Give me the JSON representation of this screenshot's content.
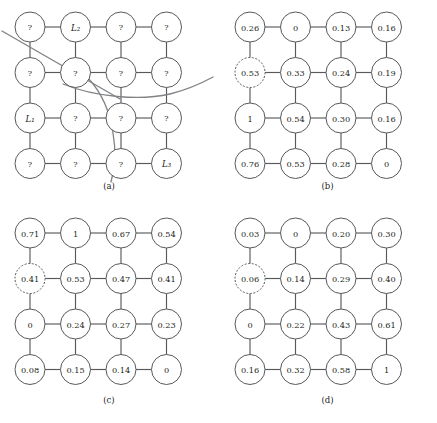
{
  "figure": {
    "panels": [
      {
        "id": "a",
        "caption": "(a)",
        "type": "unknown-labels",
        "rows": 4,
        "cols": 4,
        "dashed_node": null,
        "cells": [
          [
            "?",
            "L₂",
            "?",
            "?"
          ],
          [
            "?",
            "?",
            "?",
            "?"
          ],
          [
            "L₁",
            "?",
            "?",
            "?"
          ],
          [
            "?",
            "?",
            "?",
            "L₃"
          ]
        ],
        "overlay_curves": [
          "diagonal-line-upper-left-to-lower-right",
          "sweeping-curve-left-to-right-edge",
          "descending-curve-through-bottom-row"
        ]
      },
      {
        "id": "b",
        "caption": "(b)",
        "type": "value-grid",
        "rows": 4,
        "cols": 4,
        "dashed_node": {
          "row": 1,
          "col": 0
        },
        "cells": [
          [
            "0.26",
            "0",
            "0.13",
            "0.16"
          ],
          [
            "0.53",
            "0.33",
            "0.24",
            "0.19"
          ],
          [
            "1",
            "0.54",
            "0.30",
            "0.16"
          ],
          [
            "0.76",
            "0.53",
            "0.28",
            "0"
          ]
        ],
        "overlay_curves": []
      },
      {
        "id": "c",
        "caption": "(c)",
        "type": "value-grid",
        "rows": 4,
        "cols": 4,
        "dashed_node": {
          "row": 1,
          "col": 0
        },
        "cells": [
          [
            "0.71",
            "1",
            "0.67",
            "0.54"
          ],
          [
            "0.41",
            "0.53",
            "0.47",
            "0.41"
          ],
          [
            "0",
            "0.24",
            "0.27",
            "0.23"
          ],
          [
            "0.08",
            "0.15",
            "0.14",
            "0"
          ]
        ],
        "overlay_curves": []
      },
      {
        "id": "d",
        "caption": "(d)",
        "type": "value-grid",
        "rows": 4,
        "cols": 4,
        "dashed_node": {
          "row": 1,
          "col": 0
        },
        "cells": [
          [
            "0.03",
            "0",
            "0.20",
            "0.30"
          ],
          [
            "0.06",
            "0.14",
            "0.29",
            "0.40"
          ],
          [
            "0",
            "0.22",
            "0.43",
            "0.61"
          ],
          [
            "0.16",
            "0.32",
            "0.58",
            "1"
          ]
        ],
        "overlay_curves": []
      }
    ],
    "colors": {
      "node_stroke": "#58595b",
      "edge_stroke": "#58595b",
      "text": "#231f20",
      "curve": "#808285",
      "background": "#ffffff"
    }
  }
}
